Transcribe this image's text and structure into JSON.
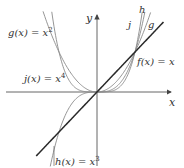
{
  "figure": {
    "axes": {
      "x_label": "x",
      "y_label": "y"
    },
    "labels": {
      "g": {
        "name": "g(x) = x",
        "sup": "2"
      },
      "j": {
        "name": "j(x) = x",
        "sup": "4"
      },
      "h": {
        "name": "h(x) = x",
        "sup": "3"
      },
      "f": {
        "name": "f(x) = x"
      },
      "j_short": "j",
      "h_short": "h",
      "g_short": "g"
    },
    "colors": {
      "axis": "#555555",
      "identity_line": "#2a2a2a",
      "power_curves": "#8a8a8a"
    }
  },
  "chart_data": {
    "type": "line",
    "title": "",
    "xlabel": "x",
    "ylabel": "y",
    "xlim": [
      -2.5,
      2.0
    ],
    "ylim": [
      -1.9,
      2.0
    ],
    "grid": false,
    "series": [
      {
        "name": "f(x) = x",
        "expr": "x",
        "points": [
          [
            -1.6,
            -1.6
          ],
          [
            -1,
            -1
          ],
          [
            0,
            0
          ],
          [
            1,
            1
          ],
          [
            1.75,
            1.75
          ]
        ]
      },
      {
        "name": "g(x) = x^2",
        "expr": "x^2",
        "points": [
          [
            -1.4,
            1.96
          ],
          [
            -1,
            1
          ],
          [
            0,
            0
          ],
          [
            1,
            1
          ],
          [
            1.4,
            1.96
          ]
        ]
      },
      {
        "name": "h(x) = x^3",
        "expr": "x^3",
        "points": [
          [
            -1.22,
            -1.82
          ],
          [
            -1,
            -1
          ],
          [
            0,
            0
          ],
          [
            1,
            1
          ],
          [
            1.25,
            1.95
          ]
        ]
      },
      {
        "name": "j(x) = x^4",
        "expr": "x^4",
        "points": [
          [
            -1.18,
            1.94
          ],
          [
            -1,
            1
          ],
          [
            0,
            0
          ],
          [
            1,
            1
          ],
          [
            1.18,
            1.94
          ]
        ]
      }
    ],
    "annotations": [
      "g(x) = x^2",
      "j(x) = x^4",
      "h(x) = x^3",
      "f(x) = x",
      "j",
      "h",
      "g"
    ]
  }
}
